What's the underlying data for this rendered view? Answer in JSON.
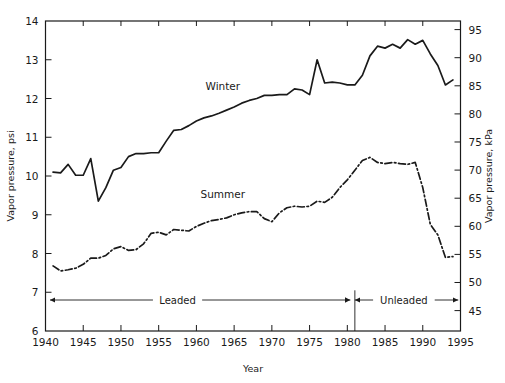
{
  "chart_data": {
    "type": "line",
    "title": "",
    "xlabel": "Year",
    "ylabel": "Vapor pressure, psi",
    "y2label": "Vapor pressure, kPa",
    "xlim": [
      1940,
      1995
    ],
    "ylim": [
      6,
      14
    ],
    "y2lim": [
      41.37,
      96.53
    ],
    "xticks": [
      1940,
      1945,
      1950,
      1955,
      1960,
      1965,
      1970,
      1975,
      1980,
      1985,
      1990,
      1995
    ],
    "xtick_labels": [
      "1940",
      "1945",
      "1950",
      "1955",
      "1960",
      "1965",
      "1970",
      "1975",
      "1980",
      "1985",
      "1990",
      "1995"
    ],
    "yticks": [
      6,
      7,
      8,
      9,
      10,
      11,
      12,
      13,
      14
    ],
    "ytick_labels": [
      "6",
      "7",
      "8",
      "9",
      "10",
      "11",
      "12",
      "13",
      "14"
    ],
    "y2ticks": [
      45,
      50,
      55,
      60,
      65,
      70,
      75,
      80,
      85,
      90,
      95
    ],
    "y2tick_labels": [
      "45",
      "50",
      "55",
      "60",
      "65",
      "70",
      "75",
      "80",
      "85",
      "90",
      "95"
    ],
    "grid": false,
    "legend_position": "inline-annotations",
    "minor_xticks_top": true,
    "series": [
      {
        "name": "Winter",
        "style": "solid",
        "color": "#1a1a1a",
        "label_x": 1963.5,
        "label_y": 12.22,
        "x": [
          1941,
          1942,
          1943,
          1944,
          1945,
          1946,
          1947,
          1948,
          1949,
          1950,
          1951,
          1952,
          1953,
          1954,
          1955,
          1956,
          1957,
          1958,
          1959,
          1960,
          1961,
          1962,
          1963,
          1964,
          1965,
          1966,
          1967,
          1968,
          1969,
          1970,
          1971,
          1972,
          1973,
          1974,
          1975,
          1976,
          1977,
          1978,
          1979,
          1980,
          1981,
          1982,
          1983,
          1984,
          1985,
          1986,
          1987,
          1988,
          1989,
          1990,
          1991,
          1992,
          1993,
          1994
        ],
        "y": [
          10.1,
          10.08,
          10.3,
          10.02,
          10.02,
          10.45,
          9.35,
          9.7,
          10.15,
          10.22,
          10.5,
          10.58,
          10.58,
          10.6,
          10.6,
          10.9,
          11.18,
          11.2,
          11.3,
          11.42,
          11.5,
          11.55,
          11.62,
          11.7,
          11.78,
          11.88,
          11.95,
          12.0,
          12.08,
          12.08,
          12.1,
          12.1,
          12.25,
          12.22,
          12.1,
          13.0,
          12.4,
          12.42,
          12.4,
          12.35,
          12.35,
          12.6,
          13.1,
          13.35,
          13.3,
          13.4,
          13.3,
          13.52,
          13.4,
          13.5,
          13.15,
          12.85,
          12.35,
          12.48
        ]
      },
      {
        "name": "Summer",
        "style": "dash-dot",
        "color": "#1a1a1a",
        "label_x": 1963.5,
        "label_y": 9.42,
        "x": [
          1941,
          1942,
          1943,
          1944,
          1945,
          1946,
          1947,
          1948,
          1949,
          1950,
          1951,
          1952,
          1953,
          1954,
          1955,
          1956,
          1957,
          1958,
          1959,
          1960,
          1961,
          1962,
          1963,
          1964,
          1965,
          1966,
          1967,
          1968,
          1969,
          1970,
          1971,
          1972,
          1973,
          1974,
          1975,
          1976,
          1977,
          1978,
          1979,
          1980,
          1981,
          1982,
          1983,
          1984,
          1985,
          1986,
          1987,
          1988,
          1989,
          1990,
          1991,
          1992,
          1993,
          1994
        ],
        "y": [
          7.68,
          7.55,
          7.58,
          7.62,
          7.72,
          7.88,
          7.88,
          7.95,
          8.12,
          8.18,
          8.08,
          8.1,
          8.25,
          8.52,
          8.55,
          8.48,
          8.62,
          8.6,
          8.58,
          8.7,
          8.78,
          8.85,
          8.88,
          8.92,
          9.0,
          9.05,
          9.08,
          9.08,
          8.9,
          8.82,
          9.05,
          9.18,
          9.22,
          9.2,
          9.22,
          9.35,
          9.32,
          9.45,
          9.7,
          9.9,
          10.15,
          10.4,
          10.48,
          10.35,
          10.32,
          10.35,
          10.32,
          10.3,
          10.35,
          9.7,
          8.75,
          8.48,
          7.9,
          7.92
        ]
      }
    ],
    "annotations": [
      {
        "name": "leaded",
        "label": "Leaded",
        "x_start": 1940.6,
        "x_end": 1980.4,
        "y": 6.8,
        "label_x": 1957.5
      },
      {
        "name": "unleaded",
        "label": "Unleaded",
        "x_start": 1981.0,
        "x_end": 1994.7,
        "y": 6.8,
        "label_x": 1987.5
      }
    ],
    "divider": {
      "name": "leaded-unleaded-divider",
      "x": 1981.0,
      "y_top": 7.05,
      "y_bottom": 6.0
    }
  }
}
